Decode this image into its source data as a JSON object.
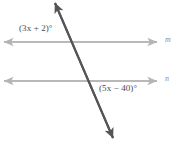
{
  "figure": {
    "type": "geometry-diagram",
    "width": 179,
    "height": 144,
    "background_color": "#ffffff"
  },
  "colors": {
    "parallel_line": "#b5b5b5",
    "transversal_line": "#555555",
    "angle_label_text": "#4a4a4a",
    "line_label_text": "#8c8c8c"
  },
  "lines": {
    "m": {
      "name": "m",
      "label": "m",
      "orientation": "horizontal",
      "y": 42,
      "x_start": 4,
      "x_end": 157,
      "arrows": "both",
      "color": "#b5b5b5"
    },
    "n": {
      "name": "n",
      "label": "n",
      "orientation": "horizontal",
      "y": 81,
      "x_start": 4,
      "x_end": 157,
      "arrows": "both",
      "color": "#b5b5b5"
    },
    "transversal": {
      "name": "transversal",
      "label": "",
      "x_start": 55,
      "y_start": 3,
      "x_end": 113,
      "y_end": 138,
      "arrows": "both",
      "color": "#555555"
    }
  },
  "intersections": {
    "with_m": {
      "x": 70,
      "y": 42
    },
    "with_n": {
      "x": 88,
      "y": 81
    }
  },
  "angles": {
    "top": {
      "label": "(3x + 2)°",
      "expression": "3x + 2",
      "unit": "degrees",
      "position": "above-left of intersection with line m"
    },
    "bottom": {
      "label": "(5x − 40)°",
      "expression": "5x − 40",
      "unit": "degrees",
      "position": "below-right of intersection with line n"
    }
  }
}
